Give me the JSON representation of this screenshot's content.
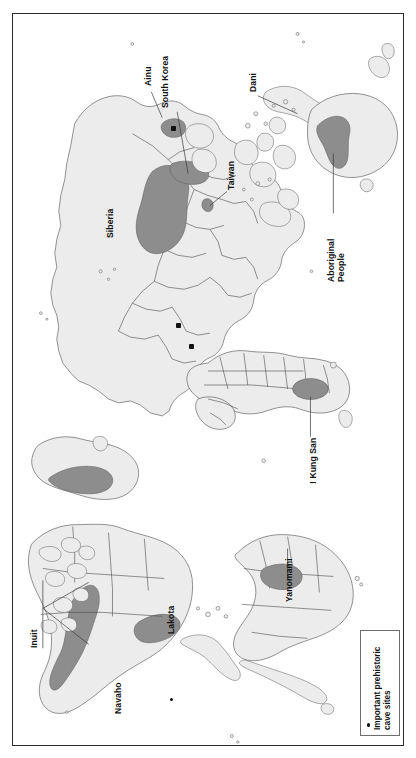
{
  "figure": {
    "type": "map",
    "orientation": "rotated-90-ccw",
    "frame": {
      "border_color": "#2b2b2b"
    }
  },
  "colors": {
    "land_fill": "#ececec",
    "land_stroke": "#555555",
    "highlight_fill": "#8d8d8d",
    "highlight_stroke": "#5a5a5a",
    "site_marker": "#111111",
    "leader_line": "#3a3a3a",
    "background": "#ffffff"
  },
  "labels": [
    {
      "id": "ainu",
      "text": "Ainu",
      "lines": [
        "Ainu"
      ]
    },
    {
      "id": "south-korea",
      "text": "South Korea",
      "lines": [
        "South Korea"
      ]
    },
    {
      "id": "taiwan",
      "text": "Taiwan",
      "lines": [
        "Taiwan"
      ]
    },
    {
      "id": "dani",
      "text": "Dani",
      "lines": [
        "Dani"
      ]
    },
    {
      "id": "aboriginal",
      "text": "Aboriginal People",
      "lines": [
        "Aboriginal",
        "People"
      ]
    },
    {
      "id": "siberia",
      "text": "Siberia",
      "lines": [
        "Siberia"
      ]
    },
    {
      "id": "kung-san",
      "text": "! Kung San",
      "lines": [
        "! Kung San"
      ]
    },
    {
      "id": "yanomami",
      "text": "Yanomami",
      "lines": [
        "Yanomami"
      ]
    },
    {
      "id": "lakota",
      "text": "Lakota",
      "lines": [
        "Lakota"
      ]
    },
    {
      "id": "navaho",
      "text": "Navaho",
      "lines": [
        "Navaho"
      ]
    },
    {
      "id": "inuit",
      "text": "Inuit",
      "lines": [
        "Inuit"
      ]
    }
  ],
  "label_text": {
    "ainu": "Ainu",
    "south_korea": "South Korea",
    "taiwan": "Taiwan",
    "dani": "Dani",
    "aboriginal_line1": "Aboriginal",
    "aboriginal_line2": "People",
    "siberia": "Siberia",
    "kung_san": "! Kung San",
    "yanomami": "Yanomami",
    "lakota": "Lakota",
    "navaho": "Navaho",
    "inuit": "Inuit"
  },
  "legend": {
    "line1": "Important prehistoric",
    "line2": "cave sites",
    "marker": "bullet-dot"
  },
  "cave_sites": [
    {
      "id": "site-japan",
      "label": ""
    },
    {
      "id": "site-europe-1",
      "label": ""
    },
    {
      "id": "site-europe-2",
      "label": ""
    },
    {
      "id": "site-navaho",
      "label": ""
    }
  ]
}
